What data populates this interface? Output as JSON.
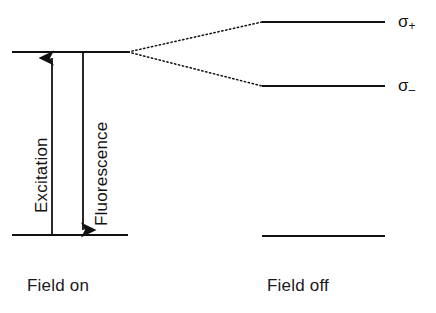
{
  "figure": {
    "type": "energy-level-diagram",
    "background_color": "#ffffff",
    "line_color": "#111111"
  },
  "panels": {
    "left": {
      "caption": "Field on",
      "levels": [
        {
          "name": "excited-level",
          "y": 52,
          "x1": 12,
          "x2": 128
        },
        {
          "name": "ground-level",
          "y": 235,
          "x1": 12,
          "x2": 128
        }
      ]
    },
    "right": {
      "caption": "Field off",
      "levels": [
        {
          "name": "sigma-plus-level",
          "y": 22,
          "x1": 262,
          "x2": 385,
          "label": "σ",
          "sublabel": "+"
        },
        {
          "name": "sigma-minus-level",
          "y": 86,
          "x1": 262,
          "x2": 385,
          "label": "σ",
          "sublabel": "–"
        },
        {
          "name": "ground-level",
          "y": 236,
          "x1": 262,
          "x2": 385
        }
      ]
    }
  },
  "transitions": [
    {
      "name": "excitation-arrow",
      "label": "Excitation",
      "direction": "up",
      "x": 52,
      "y_from": 235,
      "y_to": 55
    },
    {
      "name": "fluorescence-arrow",
      "label": "Fluorescence",
      "direction": "down",
      "x": 83,
      "y_from": 52,
      "y_to": 233
    }
  ],
  "correlation_lines": [
    {
      "name": "splitting-line-upper",
      "style": "dotted",
      "from_x": 128,
      "from_y": 52,
      "to_x": 262,
      "to_y": 22
    },
    {
      "name": "splitting-line-lower",
      "style": "dotted",
      "from_x": 128,
      "from_y": 52,
      "to_x": 262,
      "to_y": 86
    }
  ],
  "labels": {
    "sigma_plus": "σ",
    "sigma_plus_sub": "+",
    "sigma_minus": "σ",
    "sigma_minus_sub": "–"
  }
}
